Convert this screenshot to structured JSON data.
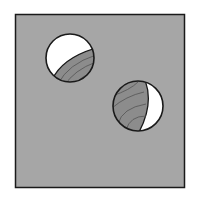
{
  "diagram": {
    "colors": {
      "background": "#ffffff",
      "panel": "#a6a6a6",
      "outline": "#1a1a1a",
      "hole_interior": "#ffffff",
      "grain_fill": "#8c8c8c",
      "grain_lines": "#5a5a5a"
    },
    "panel": {
      "x": 15,
      "y": 14,
      "width": 170,
      "height": 174
    },
    "holes": [
      {
        "name": "upper-left-hole",
        "cx": 70,
        "cy": 58,
        "r": 24
      },
      {
        "name": "lower-right-hole",
        "cx": 138,
        "cy": 106,
        "r": 25
      }
    ]
  }
}
